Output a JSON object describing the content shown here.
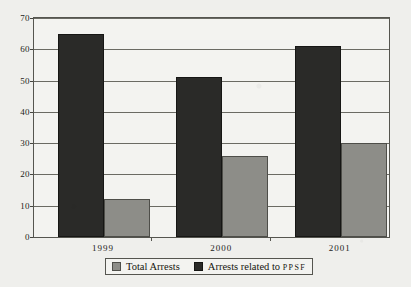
{
  "chart_data": {
    "type": "bar",
    "title": "",
    "subtitle": "",
    "xlabel": "",
    "ylabel": "",
    "categories": [
      "1999",
      "2000",
      "2001"
    ],
    "series": [
      {
        "name": "Total Arrests",
        "values": [
          12,
          26,
          30
        ],
        "color": "#8d8d88"
      },
      {
        "name": "Arrests related to PPSF",
        "values": [
          65,
          51,
          61
        ],
        "color": "#2a2a28"
      }
    ],
    "legend_labels": [
      {
        "text": "Total Arrests",
        "abbrev": ""
      },
      {
        "text": "Arrests related to ",
        "abbrev": "PPSF"
      }
    ],
    "ylim": [
      0,
      70
    ],
    "yticks": [
      0,
      10,
      20,
      30,
      40,
      50,
      60,
      70
    ],
    "ytick_labels": [
      "0",
      "10",
      "20",
      "30",
      "40",
      "50",
      "60",
      "70"
    ],
    "grid": true,
    "grid_axis": "y",
    "legend_position": "bottom",
    "background_color": "#efefec",
    "plot_background_color": "#f3f3f0",
    "axis_color": "#55554f"
  }
}
